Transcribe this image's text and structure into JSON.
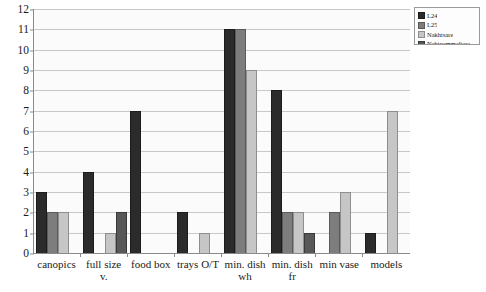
{
  "chart_data": {
    "type": "bar",
    "title": "",
    "xlabel": "",
    "ylabel": "",
    "ylim": [
      0,
      12
    ],
    "yticks": [
      0,
      1,
      2,
      3,
      4,
      5,
      6,
      7,
      8,
      9,
      10,
      11,
      12
    ],
    "grid": true,
    "legend_position": "top-right",
    "categories": [
      "canopics",
      "full size v.",
      "food box",
      "trays O/T",
      "min. dish wh",
      "min. dish fr",
      "min vase",
      "models"
    ],
    "series": [
      {
        "name": "L24",
        "color": "#2b2b2b",
        "values": [
          3,
          4,
          7,
          2,
          11,
          8,
          null,
          1
        ]
      },
      {
        "name": "L25",
        "color": "#7d7d7d",
        "values": [
          2,
          null,
          null,
          null,
          11,
          2,
          2,
          null
        ]
      },
      {
        "name": "Nakhtsare",
        "color": "#c6c6c6",
        "values": [
          2,
          1,
          null,
          1,
          9,
          2,
          3,
          7
        ]
      },
      {
        "name": "Nehtyemmeltere",
        "color": "#585858",
        "values": [
          null,
          2,
          null,
          null,
          null,
          1,
          null,
          null
        ]
      }
    ]
  },
  "legend": {
    "items": [
      {
        "label": "L24"
      },
      {
        "label": "L25"
      },
      {
        "label": "Nakhtsare"
      },
      {
        "label": "Nehtyemmeltere"
      }
    ]
  }
}
